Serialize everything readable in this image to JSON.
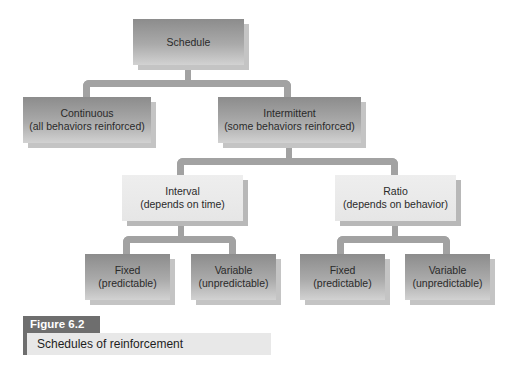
{
  "diagram": {
    "type": "hierarchy-tree",
    "root": {
      "label": "Schedule",
      "children": [
        {
          "label": "Continuous",
          "sublabel": "(all behaviors reinforced)"
        },
        {
          "label": "Intermittent",
          "sublabel": "(some behaviors reinforced)",
          "children": [
            {
              "label": "Interval",
              "sublabel": "(depends on time)",
              "children": [
                {
                  "label": "Fixed",
                  "sublabel": "(predictable)"
                },
                {
                  "label": "Variable",
                  "sublabel": "(unpredictable)"
                }
              ]
            },
            {
              "label": "Ratio",
              "sublabel": "(depends on behavior)",
              "children": [
                {
                  "label": "Fixed",
                  "sublabel": "(predictable)"
                },
                {
                  "label": "Variable",
                  "sublabel": "(unpredictable)"
                }
              ]
            }
          ]
        }
      ]
    }
  },
  "nodes": {
    "schedule": {
      "label": "Schedule"
    },
    "continuous": {
      "label": "Continuous",
      "sublabel": "(all behaviors reinforced)"
    },
    "intermittent": {
      "label": "Intermittent",
      "sublabel": "(some behaviors reinforced)"
    },
    "interval": {
      "label": "Interval",
      "sublabel": "(depends on time)"
    },
    "ratio": {
      "label": "Ratio",
      "sublabel": "(depends on behavior)"
    },
    "interval_fixed": {
      "label": "Fixed",
      "sublabel": "(predictable)"
    },
    "interval_variable": {
      "label": "Variable",
      "sublabel": "(unpredictable)"
    },
    "ratio_fixed": {
      "label": "Fixed",
      "sublabel": "(predictable)"
    },
    "ratio_variable": {
      "label": "Variable",
      "sublabel": "(unpredictable)"
    }
  },
  "figure": {
    "label": "Figure 6.2",
    "caption": "Schedules of reinforcement"
  },
  "colors": {
    "dark_box": "#9a9a9a",
    "light_box": "#e8e8e8",
    "connector": "#a2a2a2",
    "figure_label_bg": "#6e6e6e"
  }
}
